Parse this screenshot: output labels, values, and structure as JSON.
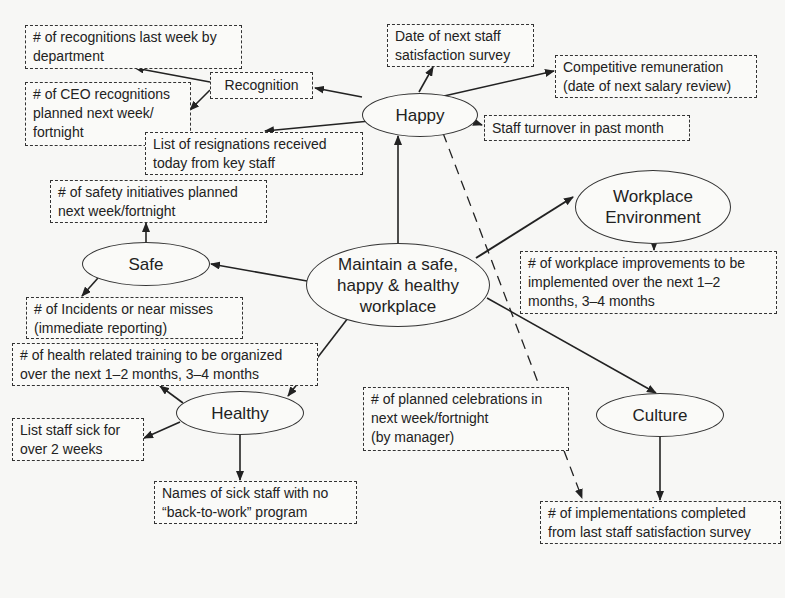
{
  "diagram": {
    "central": {
      "label": "Maintain a safe,\nhappy & healthy\nworkplace"
    },
    "nodes": {
      "happy": "Happy",
      "safe": "Safe",
      "healthy": "Healthy",
      "workplace_environment": "Workplace\nEnvironment",
      "culture": "Culture"
    },
    "boxes": {
      "recognition": "Recognition",
      "recognitions_last_week": "# of recognitions last week by\ndepartment",
      "ceo_recognitions": "# of CEO recognitions\nplanned next week/\nfortnight",
      "resignations": "List of resignations received\ntoday from key staff",
      "next_survey_date": "Date of next staff\nsatisfaction survey",
      "remuneration": "Competitive remuneration\n(date of next salary review)",
      "staff_turnover": "Staff turnover in past month",
      "safety_initiatives": "# of safety initiatives planned\nnext week/fortnight",
      "incidents": "# of Incidents or near misses\n(immediate reporting)",
      "health_training": "# of health related training to be organized\nover the next 1–2 months, 3–4 months",
      "sick_staff": "List staff sick for\nover 2 weeks",
      "back_to_work": "Names of sick staff with no\n“back-to-work” program",
      "workplace_improvements": "# of workplace improvements to be\nimplemented over the next 1–2\nmonths, 3–4 months",
      "celebrations": "# of planned celebrations in\nnext week/fortnight\n(by manager)",
      "implementations": "# of implementations completed\nfrom last staff satisfaction survey"
    },
    "edges": [
      {
        "from": "central",
        "to": "happy"
      },
      {
        "from": "central",
        "to": "safe"
      },
      {
        "from": "central",
        "to": "healthy"
      },
      {
        "from": "central",
        "to": "workplace_environment"
      },
      {
        "from": "central",
        "to": "culture"
      },
      {
        "from": "happy",
        "to": "recognition"
      },
      {
        "from": "happy",
        "to": "resignations"
      },
      {
        "from": "happy",
        "to": "next_survey_date"
      },
      {
        "from": "happy",
        "to": "remuneration"
      },
      {
        "from": "happy",
        "to": "staff_turnover"
      },
      {
        "from": "happy",
        "to": "implementations",
        "style": "dashed"
      },
      {
        "from": "recognition",
        "to": "recognitions_last_week"
      },
      {
        "from": "recognition",
        "to": "ceo_recognitions"
      },
      {
        "from": "safe",
        "to": "safety_initiatives"
      },
      {
        "from": "safe",
        "to": "incidents"
      },
      {
        "from": "healthy",
        "to": "health_training"
      },
      {
        "from": "healthy",
        "to": "sick_staff"
      },
      {
        "from": "healthy",
        "to": "back_to_work"
      },
      {
        "from": "workplace_environment",
        "to": "workplace_improvements"
      },
      {
        "from": "culture",
        "to": "celebrations"
      },
      {
        "from": "culture",
        "to": "implementations"
      }
    ]
  }
}
